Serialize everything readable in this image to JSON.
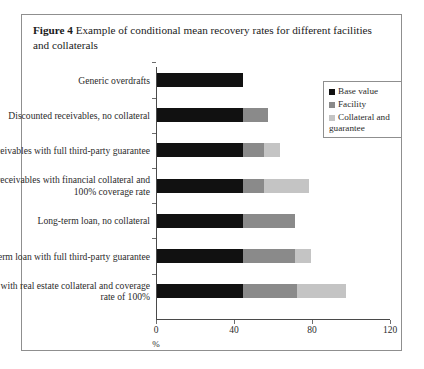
{
  "caption": {
    "label": "Figure 4",
    "text": "Example of conditional mean recovery rates for different facilities and collaterals"
  },
  "chart_data": {
    "type": "bar",
    "orientation": "horizontal",
    "stacked": true,
    "title": "Example of conditional mean recovery rates for different facilities and collaterals",
    "xlabel": "%",
    "ylabel": "",
    "xlim": [
      0,
      120
    ],
    "xticks": [
      0,
      40,
      80,
      120
    ],
    "xtick_labels": [
      "0",
      "40",
      "80",
      "120"
    ],
    "grid": false,
    "legend_position": "top-right",
    "categories": [
      "Generic overdrafts",
      "Discounted receivables, no collateral",
      "Discounted receivables with full third-party guarantee",
      "Discounted receivables with financial collateral and 100% coverage rate",
      "Long-term loan, no collateral",
      "Long- term loan with full third-party guarantee",
      "Mortgage loan with real estate collateral and coverage rate of 100%"
    ],
    "series": [
      {
        "name": "Base value",
        "color": "#111111",
        "values": [
          44,
          44,
          44,
          44,
          44,
          44,
          44
        ]
      },
      {
        "name": "Facility",
        "color": "#8a8a8a",
        "values": [
          0,
          13,
          11,
          11,
          27,
          27,
          28
        ]
      },
      {
        "name": "Collateral and guarantee",
        "color": "#c4c4c4",
        "values": [
          0,
          0,
          8,
          23,
          0,
          8,
          25
        ]
      }
    ],
    "totals": [
      44,
      57,
      63,
      78,
      71,
      79,
      97
    ]
  },
  "legend": {
    "items": [
      {
        "label": "Base value",
        "color": "#111111"
      },
      {
        "label": "Facility",
        "color": "#8a8a8a"
      },
      {
        "label": "Collateral and guarantee",
        "color": "#c4c4c4"
      }
    ]
  }
}
